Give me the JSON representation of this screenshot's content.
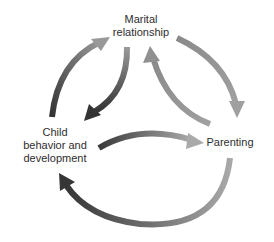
{
  "diagram": {
    "type": "cycle",
    "nodes": [
      {
        "id": "marital",
        "lines": [
          "Marital",
          "relationship"
        ]
      },
      {
        "id": "child",
        "lines": [
          "Child",
          "behavior and",
          "development"
        ]
      },
      {
        "id": "parenting",
        "lines": [
          "Parenting"
        ]
      }
    ],
    "edges": [
      {
        "from": "child",
        "to": "marital",
        "style": "outer-arc"
      },
      {
        "from": "marital",
        "to": "child",
        "style": "inner-arc"
      },
      {
        "from": "parenting",
        "to": "marital",
        "style": "inner-arc"
      },
      {
        "from": "marital",
        "to": "parenting",
        "style": "outer-arc"
      },
      {
        "from": "child",
        "to": "parenting",
        "style": "inner-arc"
      },
      {
        "from": "parenting",
        "to": "child",
        "style": "outer-arc"
      }
    ],
    "colors": {
      "arrow_dark": "#3c3c3c",
      "arrow_mid": "#7a7a7a",
      "arrow_light": "#a8a8a8",
      "text": "#2e2e2e",
      "background": "#ffffff"
    }
  }
}
